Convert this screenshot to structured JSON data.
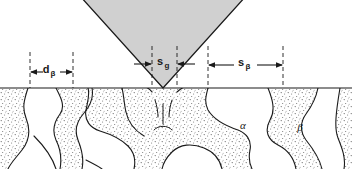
{
  "figure": {
    "background_color": "#ffffff",
    "line_color": "#1a1a1a",
    "indenter_fill": "#d0d0d0",
    "beta_stipple_color": "#555555"
  },
  "indenter": {
    "name": "pyramidal-indenter",
    "fill_color": "#d0d0d0",
    "apex_x": 163,
    "apex_y": 88,
    "half_angle_deg": 50
  },
  "surface": {
    "label": "specimen-surface",
    "y": 88
  },
  "dimensions": [
    {
      "id": "d-beta",
      "symbol": "d",
      "subscript": "β",
      "display": "dβ",
      "arrow_direction": "outward",
      "left_x": 30,
      "right_x": 73,
      "label_x": 51,
      "label_y": 71,
      "arrow_y": 72,
      "dash_top": 52,
      "dash_bottom": 88,
      "meaning": "beta phase grain width"
    },
    {
      "id": "s-g",
      "symbol": "s",
      "subscript": "g",
      "display": "sg",
      "arrow_direction": "inward",
      "left_x": 152,
      "right_x": 177,
      "label_x": 164,
      "label_y": 64,
      "arrow_y": 64,
      "dash_top": 46,
      "dash_bottom": 88,
      "meaning": "indent contact width at surface"
    },
    {
      "id": "s-beta",
      "symbol": "s",
      "subscript": "β",
      "display": "sβ",
      "arrow_direction": "outward",
      "left_x": 208,
      "right_x": 283,
      "label_x": 245,
      "label_y": 64,
      "arrow_y": 65,
      "dash_top": 46,
      "dash_bottom": 88,
      "meaning": "beta phase spacing"
    }
  ],
  "phase_labels": [
    {
      "id": "alpha-phase-label",
      "text": "α",
      "x": 243,
      "y": 129,
      "region": "light matrix"
    },
    {
      "id": "beta-phase-label",
      "text": "β",
      "x": 300,
      "y": 131,
      "region": "stippled phase"
    }
  ],
  "legend_notes": {
    "alpha": "α",
    "beta": "β"
  }
}
